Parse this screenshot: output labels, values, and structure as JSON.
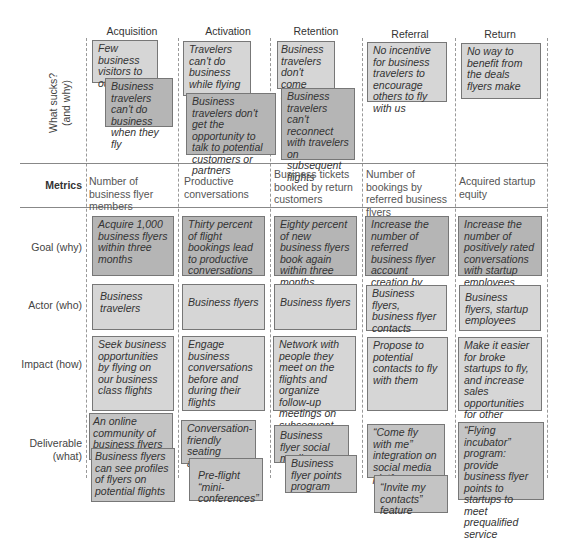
{
  "columns": [
    {
      "label": "Acquisition"
    },
    {
      "label": "Activation"
    },
    {
      "label": "Retention"
    },
    {
      "label": "Referral"
    },
    {
      "label": "Return"
    }
  ],
  "rows": {
    "what_sucks": {
      "label_line1": "What sucks?",
      "label_line2": "(and why)"
    },
    "metrics": {
      "label": "Metrics"
    },
    "goal": {
      "label": "Goal (why)"
    },
    "actor": {
      "label": "Actor (who)"
    },
    "impact": {
      "label": "Impact (how)"
    },
    "deliverable": {
      "label_line1": "Deliverable",
      "label_line2": "(what)"
    }
  },
  "what_sucks": {
    "acquisition": [
      "Few business visitors to our site",
      "Business travelers can't do business when they fly"
    ],
    "activation": [
      "Travelers can't do business while flying",
      "Business travelers don't get the opportunity to talk to potential customers or partners"
    ],
    "retention": [
      "Business travelers don't come back",
      "Business travelers can't reconnect with travelers on subsequent flights"
    ],
    "referral": [
      "No incentive for business travelers to encourage others to fly with us"
    ],
    "return": [
      "No way to benefit from the deals flyers make"
    ]
  },
  "metrics": {
    "acquisition": "Number of business flyer members",
    "activation": "Productive conversations",
    "retention": "Business tickets booked by return customers",
    "referral": "Number of bookings by referred business flyers",
    "return": "Acquired startup equity"
  },
  "goal": {
    "acquisition": "Acquire 1,000 business flyers within three months",
    "activation": "Thirty percent of flight bookings lead to productive conversations",
    "retention": "Eighty percent of new business flyers book again within three months",
    "referral": "Increase the number of referred business flyer account creation by 30%",
    "return": "Increase the number of positively rated conversations with startup employees"
  },
  "actor": {
    "acquisition": "Business travelers",
    "activation": "Business flyers",
    "retention": "Business flyers",
    "referral": "Business flyers, business flyer contacts",
    "return": "Business flyers, startup employees"
  },
  "impact": {
    "acquisition": "Seek business opportunities by flying on our business class flights",
    "activation": "Engage business conversations before and during their flights",
    "retention": "Network with people they meet on the flights and organize follow-up meetings on subsequent flights",
    "referral": "Propose to potential contacts to fly with them",
    "return": "Make it easier for broke startups to fly, and increase sales opportunities for other travelers"
  },
  "deliverable": {
    "acquisition": [
      "An online community of business flyers",
      "Business flyers can see profiles of flyers on potential flights"
    ],
    "activation": [
      "Conversation-friendly seating arrangements",
      "Pre-flight “mini-conferences”"
    ],
    "retention": [
      "Business flyer social media app",
      "Business flyer points program"
    ],
    "referral": [
      "“Come fly with me” integration on social media platforms",
      "“Invite my contacts” feature"
    ],
    "return": [
      "“Flying incubator” program: provide business flyer points to startups to meet prequalified service providers"
    ]
  }
}
